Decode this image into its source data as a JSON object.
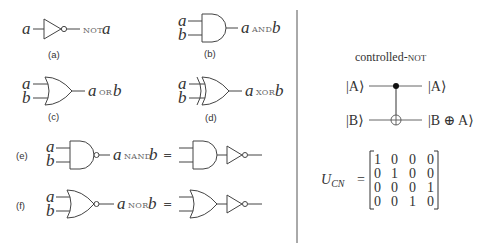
{
  "gates": {
    "not": {
      "input": "a",
      "output_op": "NOT",
      "output_var": "a",
      "caption": "(a)"
    },
    "and": {
      "input_a": "a",
      "input_b": "b",
      "out_a": "a",
      "op": "AND",
      "out_b": "b",
      "caption": "(b)"
    },
    "or": {
      "input_a": "a",
      "input_b": "b",
      "out_a": "a",
      "op": "OR",
      "out_b": "b",
      "caption": "(c)"
    },
    "xor": {
      "input_a": "a",
      "input_b": "b",
      "out_a": "a",
      "op": "XOR",
      "out_b": "b",
      "caption": "(d)"
    },
    "nand": {
      "label": "(e)",
      "input_a": "a",
      "input_b": "b",
      "out_a": "a",
      "op": "NAND",
      "out_b": "b",
      "equals": "="
    },
    "nor": {
      "label": "(f)",
      "input_a": "a",
      "input_b": "b",
      "out_a": "a",
      "op": "NOR",
      "out_b": "b",
      "equals": "="
    }
  },
  "cnot": {
    "title_prefix": "controlled-",
    "title_sc": "NOT",
    "in_top": "|A⟩",
    "in_bottom": "|B⟩",
    "out_top": "|A⟩",
    "out_bottom": "|B ⊕ A⟩"
  },
  "matrix": {
    "lhs_main": "U",
    "lhs_sub": "CN",
    "equals": "=",
    "rows": [
      [
        "1",
        "0",
        "0",
        "0"
      ],
      [
        "0",
        "1",
        "0",
        "0"
      ],
      [
        "0",
        "0",
        "0",
        "1"
      ],
      [
        "0",
        "0",
        "1",
        "0"
      ]
    ]
  }
}
